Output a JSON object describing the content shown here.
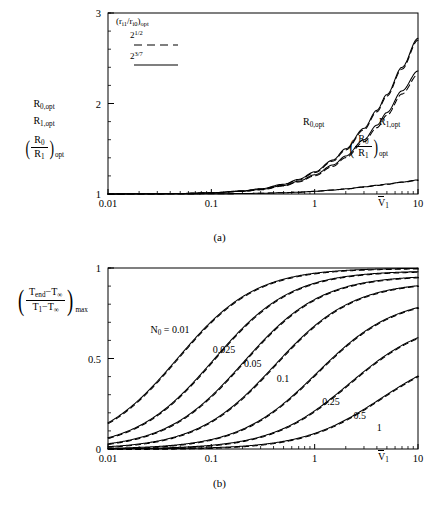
{
  "figure": {
    "panels": [
      {
        "id": "a",
        "caption": "(a)",
        "legend": {
          "title_main": "r",
          "title_text": "(r",
          "sub1": "i1",
          "slash": "/r",
          "sub2": "i0",
          "close": ")",
          "sub_opt": "opt",
          "entries": [
            {
              "base": "2",
              "exp": "1/2",
              "style": "dashed"
            },
            {
              "base": "2",
              "exp": "3/7",
              "style": "solid"
            }
          ]
        },
        "yaxis": {
          "label_line1_base": "R",
          "label_line1_sub": "0,opt",
          "label_line2_base": "R",
          "label_line2_sub": "1,opt",
          "label_frac_num_base": "R",
          "label_frac_num_sub": "0",
          "label_frac_den_base": "R",
          "label_frac_den_sub": "1",
          "label_frac_sub": "opt",
          "ticks": [
            "1",
            "2",
            "3"
          ],
          "min": 1,
          "max": 3
        },
        "xaxis": {
          "label_base": "V",
          "label_sub": "1",
          "ticks": [
            "0.01",
            "0.1",
            "1",
            "10"
          ],
          "min": 0.01,
          "max": 10,
          "scale": "log"
        },
        "annotations": [
          {
            "name": "R0opt",
            "base": "R",
            "sub": "0,opt",
            "x": 308,
            "y": 123
          },
          {
            "name": "R1opt",
            "base": "R",
            "sub": "1,opt",
            "x": 383,
            "y": 123
          },
          {
            "name": "ratio",
            "num_base": "R",
            "num_sub": "0",
            "den_base": "R",
            "den_sub": "1",
            "sub": "opt",
            "x": 355,
            "y": 140
          }
        ]
      },
      {
        "id": "b",
        "caption": "(b)",
        "legend": {
          "title_text": "(r",
          "sub1": "i1",
          "slash": "/r",
          "sub2": "i0",
          "close": ")",
          "sub_opt": "opt",
          "entries": [
            {
              "base": "2",
              "exp": "1/2",
              "style": "dashed"
            },
            {
              "base": "2",
              "exp": "3/7",
              "style": "solid"
            }
          ]
        },
        "yaxis": {
          "num_t1": "T",
          "num_sub1": "end",
          "num_minus": "−T",
          "num_sub2": "∞",
          "den_t1": "T",
          "den_sub1": "1",
          "den_minus": "−T",
          "den_sub2": "∞",
          "outer_sub": "max",
          "ticks": [
            "0",
            "0.5",
            "1"
          ],
          "min": 0,
          "max": 1
        },
        "xaxis": {
          "label_base": "V",
          "label_sub": "1",
          "ticks": [
            "0.01",
            "0.1",
            "1",
            "10"
          ],
          "min": 0.01,
          "max": 10,
          "scale": "log"
        },
        "curve_label_prefix": "N",
        "curve_label_prefix_sub": "0",
        "curve_label_eq": " = "
      }
    ]
  },
  "chart_data": [
    {
      "type": "line",
      "panel": "a",
      "title": "",
      "xlabel": "V̅1",
      "ylabel": "R0,opt  R1,opt  (R0/R1)opt",
      "xscale": "log",
      "xlim": [
        0.01,
        10
      ],
      "ylim": [
        1,
        3
      ],
      "xticks": [
        0.01,
        0.1,
        1,
        10
      ],
      "yticks": [
        1,
        2,
        3
      ],
      "grid": false,
      "legend_position": "top-left",
      "series": [
        {
          "name": "R0,opt (2^3/7, solid)",
          "style": "solid",
          "x": [
            0.01,
            0.02,
            0.05,
            0.1,
            0.2,
            0.3,
            0.5,
            0.7,
            1.0,
            1.5,
            2.0,
            3.0,
            4.0,
            5.0,
            7.0,
            10.0
          ],
          "y": [
            1.001,
            1.002,
            1.006,
            1.014,
            1.035,
            1.058,
            1.108,
            1.162,
            1.245,
            1.375,
            1.5,
            1.725,
            1.925,
            2.1,
            2.4,
            2.72
          ]
        },
        {
          "name": "R0,opt (2^1/2, dashed)",
          "style": "dashed",
          "x": [
            0.01,
            0.02,
            0.05,
            0.1,
            0.2,
            0.3,
            0.5,
            0.7,
            1.0,
            1.5,
            2.0,
            3.0,
            4.0,
            5.0,
            7.0,
            10.0
          ],
          "y": [
            1.001,
            1.002,
            1.006,
            1.013,
            1.033,
            1.055,
            1.103,
            1.155,
            1.236,
            1.363,
            1.487,
            1.71,
            1.908,
            2.082,
            2.38,
            2.7
          ]
        },
        {
          "name": "R1,opt (2^3/7, solid)",
          "style": "solid",
          "x": [
            0.01,
            0.02,
            0.05,
            0.1,
            0.2,
            0.3,
            0.5,
            0.7,
            1.0,
            1.5,
            2.0,
            3.0,
            4.0,
            5.0,
            7.0,
            10.0
          ],
          "y": [
            1.001,
            1.002,
            1.005,
            1.012,
            1.03,
            1.05,
            1.094,
            1.141,
            1.212,
            1.32,
            1.42,
            1.6,
            1.76,
            1.9,
            2.14,
            2.36
          ]
        },
        {
          "name": "R1,opt (2^1/2, dashed)",
          "style": "dashed",
          "x": [
            0.01,
            0.02,
            0.05,
            0.1,
            0.2,
            0.3,
            0.5,
            0.7,
            1.0,
            1.5,
            2.0,
            3.0,
            4.0,
            5.0,
            7.0,
            10.0
          ],
          "y": [
            1.001,
            1.002,
            1.005,
            1.011,
            1.028,
            1.046,
            1.088,
            1.133,
            1.201,
            1.305,
            1.402,
            1.576,
            1.732,
            1.87,
            2.105,
            2.32
          ]
        },
        {
          "name": "(R0/R1)opt (2^3/7, solid)",
          "style": "solid",
          "x": [
            0.01,
            0.02,
            0.05,
            0.1,
            0.2,
            0.3,
            0.5,
            0.7,
            1.0,
            1.5,
            2.0,
            3.0,
            4.0,
            5.0,
            7.0,
            10.0
          ],
          "y": [
            1.0,
            1.0,
            1.001,
            1.002,
            1.005,
            1.008,
            1.014,
            1.02,
            1.03,
            1.044,
            1.057,
            1.079,
            1.096,
            1.11,
            1.132,
            1.155
          ]
        },
        {
          "name": "(R0/R1)opt (2^1/2, dashed)",
          "style": "dashed",
          "x": [
            0.01,
            0.02,
            0.05,
            0.1,
            0.2,
            0.3,
            0.5,
            0.7,
            1.0,
            1.5,
            2.0,
            3.0,
            4.0,
            5.0,
            7.0,
            10.0
          ],
          "y": [
            1.0,
            1.0,
            1.001,
            1.002,
            1.005,
            1.008,
            1.014,
            1.02,
            1.029,
            1.043,
            1.055,
            1.076,
            1.093,
            1.107,
            1.129,
            1.151
          ]
        }
      ]
    },
    {
      "type": "line",
      "panel": "b",
      "title": "",
      "xlabel": "V̅1",
      "ylabel": "((Tend−T∞)/(T1−T∞))max",
      "xscale": "log",
      "xlim": [
        0.01,
        10
      ],
      "ylim": [
        0,
        1
      ],
      "xticks": [
        0.01,
        0.1,
        1,
        10
      ],
      "yticks": [
        0,
        0.5,
        1
      ],
      "grid": false,
      "legend_position": "top-left",
      "series": [
        {
          "name": "N0 = 0.01",
          "label": "0.01",
          "label_x": 0.055,
          "label_y": 0.655,
          "prefix": true,
          "x50": 0.047
        },
        {
          "name": "N0 = 0.025",
          "label": "0.025",
          "label_x": 0.135,
          "label_y": 0.545,
          "x50": 0.105
        },
        {
          "name": "N0 = 0.05",
          "label": "0.05",
          "label_x": 0.27,
          "label_y": 0.47,
          "x50": 0.205
        },
        {
          "name": "N0 = 0.1",
          "label": "0.1",
          "label_x": 0.56,
          "label_y": 0.385,
          "x50": 0.41
        },
        {
          "name": "N0 = 0.25",
          "label": "0.25",
          "label_x": 1.55,
          "label_y": 0.26,
          "x50": 1.05
        },
        {
          "name": "N0 = 0.5",
          "label": "0.5",
          "label_x": 3.1,
          "label_y": 0.185,
          "x50": 2.15
        },
        {
          "name": "N0 = 1",
          "label": "1",
          "label_x": 5.2,
          "label_y": 0.115,
          "x50": 4.4
        }
      ]
    }
  ]
}
